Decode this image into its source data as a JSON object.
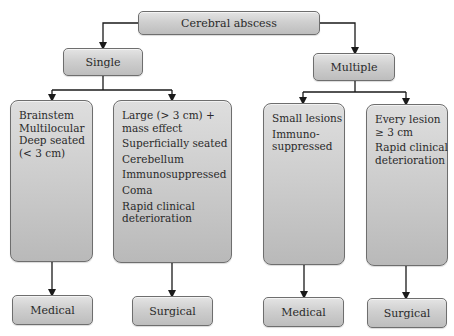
{
  "diagram": {
    "type": "flowchart",
    "root": {
      "label": "Cerebral abscess"
    },
    "branches": [
      {
        "label": "Single",
        "criteria_groups": [
          {
            "lines": [
              "Brainstem",
              "Multilocular",
              "Deep seated",
              "(< 3 cm)"
            ],
            "outcome": "Medical"
          },
          {
            "lines": [
              "Large (> 3 cm) +",
              "mass effect",
              "Superficially seated",
              "Cerebellum",
              "Immunosuppressed",
              "Coma",
              "Rapid clinical",
              "deterioration"
            ],
            "outcome": "Surgical"
          }
        ]
      },
      {
        "label": "Multiple",
        "criteria_groups": [
          {
            "lines": [
              "Small lesions",
              "Immuno-",
              "suppressed"
            ],
            "outcome": "Medical"
          },
          {
            "lines": [
              "Every lesion",
              "≥ 3 cm",
              "Rapid clinical",
              "deterioration"
            ],
            "outcome": "Surgical"
          }
        ]
      }
    ]
  },
  "colors": {
    "box_fill_top": "#e4e4e4",
    "box_fill_bottom": "#bdbdbd",
    "box_border": "#6e6e6e",
    "connector": "#1a1a1a",
    "text": "#2a2a2a"
  }
}
